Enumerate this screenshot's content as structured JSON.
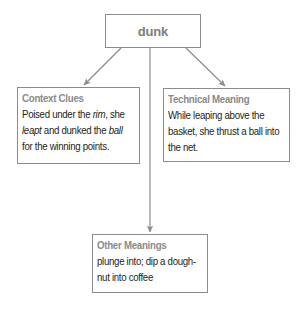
{
  "diagram": {
    "root": {
      "label": "dunk"
    },
    "nodes": [
      {
        "id": "context-clues",
        "title": "Context Clues",
        "lines": [
          [
            {
              "text": "Poised under the ",
              "italic": false
            },
            {
              "text": "rim",
              "italic": true
            },
            {
              "text": ", she",
              "italic": false
            }
          ],
          [
            {
              "text": "leapt",
              "italic": true
            },
            {
              "text": " and dunked the ",
              "italic": false
            },
            {
              "text": "ball",
              "italic": true
            }
          ],
          [
            {
              "text": "for the winning points.",
              "italic": false
            }
          ]
        ]
      },
      {
        "id": "technical-meaning",
        "title": "Technical Meaning",
        "lines": [
          [
            {
              "text": "While leaping above the",
              "italic": false
            }
          ],
          [
            {
              "text": "basket, she thrust a ball into",
              "italic": false
            }
          ],
          [
            {
              "text": "the net.",
              "italic": false
            }
          ]
        ]
      },
      {
        "id": "other-meanings",
        "title": "Other Meanings",
        "lines": [
          [
            {
              "text": "plunge into; dip a dough-",
              "italic": false
            }
          ],
          [
            {
              "text": "nut into coffee",
              "italic": false
            }
          ]
        ]
      }
    ],
    "edges": [
      {
        "from": "dunk",
        "to": "context-clues"
      },
      {
        "from": "dunk",
        "to": "technical-meaning"
      },
      {
        "from": "dunk",
        "to": "other-meanings"
      }
    ],
    "colors": {
      "border": "#8c8c8c",
      "arrow": "#8c8c8c",
      "title_text": "#8a8a8a",
      "body_text": "#231f20",
      "background": "#ffffff"
    }
  }
}
